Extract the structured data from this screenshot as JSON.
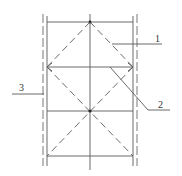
{
  "diagram": {
    "title": "",
    "labels": [
      {
        "id": "1",
        "text": "1",
        "x": 155,
        "y": 42,
        "leader": [
          [
            112,
            44
          ],
          [
            162,
            44
          ]
        ]
      },
      {
        "id": "2",
        "text": "2",
        "x": 158,
        "y": 108,
        "leader": [
          [
            110,
            67
          ],
          [
            148,
            110
          ],
          [
            170,
            110
          ]
        ]
      },
      {
        "id": "3",
        "text": "3",
        "x": 19,
        "y": 91,
        "leader": [
          [
            12,
            94
          ],
          [
            44,
            94
          ]
        ]
      }
    ],
    "outer_dashed_verticals": [
      {
        "x": 43,
        "y1": 14,
        "y2": 166
      },
      {
        "x": 137,
        "y1": 14,
        "y2": 166
      }
    ],
    "solid_verticals": [
      {
        "x": 47,
        "y1": 16,
        "y2": 166
      },
      {
        "x": 90,
        "y1": 16,
        "y2": 166
      },
      {
        "x": 133,
        "y1": 16,
        "y2": 166
      }
    ],
    "horizontals": [
      {
        "y": 22,
        "x1": 47,
        "x2": 133
      },
      {
        "y": 67,
        "x1": 47,
        "x2": 133
      },
      {
        "y": 111,
        "x1": 47,
        "x2": 133
      },
      {
        "y": 156,
        "x1": 47,
        "x2": 133
      }
    ],
    "dashed_diagonals": [
      {
        "from": [
          90,
          22
        ],
        "to": [
          47,
          67
        ]
      },
      {
        "from": [
          90,
          22
        ],
        "to": [
          133,
          67
        ]
      },
      {
        "from": [
          47,
          67
        ],
        "to": [
          133,
          156
        ]
      },
      {
        "from": [
          133,
          67
        ],
        "to": [
          47,
          156
        ]
      }
    ],
    "nodes": [
      {
        "x": 90,
        "y": 22
      },
      {
        "x": 90,
        "y": 111
      }
    ],
    "colors": {
      "line": "#5a5a5a",
      "node": "#2a2a2a",
      "text": "#333333",
      "background": "#ffffff"
    }
  }
}
